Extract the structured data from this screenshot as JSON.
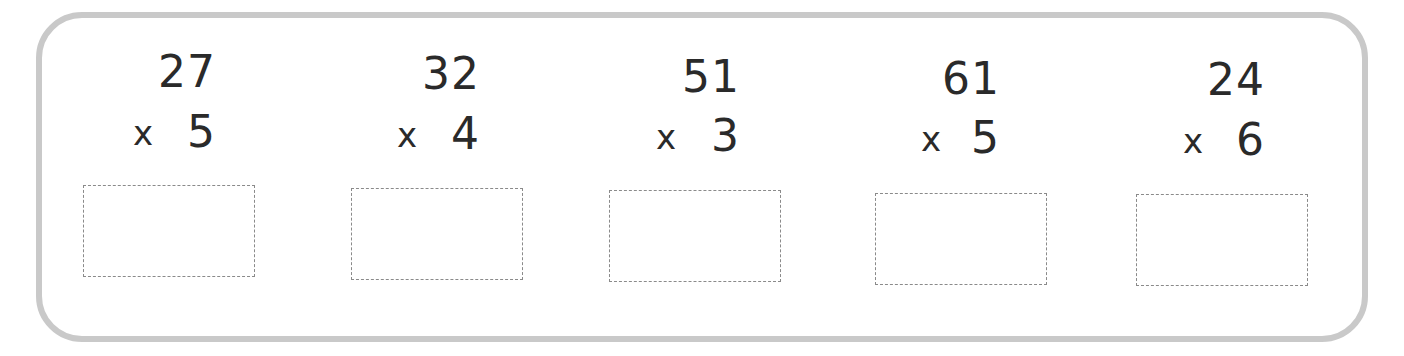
{
  "worksheet": {
    "problems": [
      {
        "multiplicand": "27",
        "operator": "x",
        "multiplier": "5",
        "answer": ""
      },
      {
        "multiplicand": "32",
        "operator": "x",
        "multiplier": "4",
        "answer": ""
      },
      {
        "multiplicand": "51",
        "operator": "x",
        "multiplier": "3",
        "answer": ""
      },
      {
        "multiplicand": "61",
        "operator": "x",
        "multiplier": "5",
        "answer": ""
      },
      {
        "multiplicand": "24",
        "operator": "x",
        "multiplier": "6",
        "answer": ""
      }
    ],
    "colors": {
      "frame_border": "#c9c9c9",
      "box_border": "#8a8a8a",
      "text": "#2a2a2a"
    }
  }
}
